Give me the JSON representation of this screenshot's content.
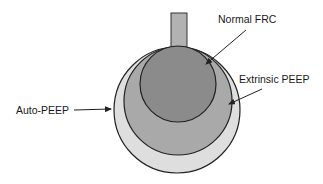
{
  "diagram": {
    "labels": {
      "normal_frc": "Normal FRC",
      "extrinsic_peep": "Extrinsic PEEP",
      "auto_peep": "Auto-PEEP"
    },
    "shapes": {
      "airway_stem": {
        "x": 171,
        "y": 13,
        "width": 16,
        "height": 34,
        "fill": "#b2b2b2"
      },
      "auto_peep_circle": {
        "cx": 177,
        "cy": 110,
        "r": 63,
        "fill": "#dedede"
      },
      "extrinsic_peep_circle": {
        "cx": 178,
        "cy": 101,
        "r": 54,
        "fill": "#a9a9a9"
      },
      "normal_frc_circle": {
        "cx": 178,
        "cy": 84,
        "r": 38,
        "fill": "#8b8b8b"
      }
    },
    "colors": {
      "stroke": "#222222",
      "text": "#1a1a1a",
      "background": "#ffffff"
    }
  }
}
